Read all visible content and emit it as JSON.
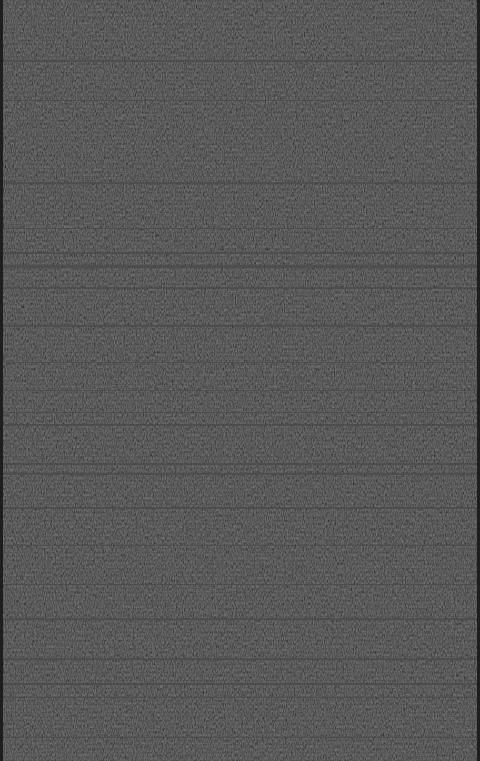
{
  "screen": {
    "description": "Static noise / no-signal texture with horizontal scan lines",
    "base_color": "#2c2c2c",
    "line_color": "#4a4a4a",
    "edge_color": "#1e1e1e"
  }
}
